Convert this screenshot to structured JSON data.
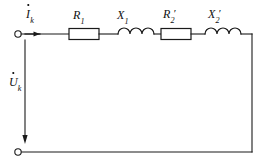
{
  "diagram": {
    "type": "electrical-schematic",
    "stroke_color": "#1a1a1a",
    "background_color": "#ffffff",
    "labels": {
      "current": {
        "symbol": "I",
        "subscript": "k",
        "prime": "",
        "overdot": true,
        "text": "İk"
      },
      "voltage": {
        "symbol": "U",
        "subscript": "k",
        "prime": "",
        "overdot": true,
        "text": "U̇k"
      },
      "r1": {
        "symbol": "R",
        "subscript": "1",
        "prime": "",
        "overdot": false,
        "text": "R1"
      },
      "x1": {
        "symbol": "X",
        "subscript": "1",
        "prime": "",
        "overdot": false,
        "text": "X1"
      },
      "r2": {
        "symbol": "R",
        "subscript": "2",
        "prime": "′",
        "overdot": false,
        "text": "R2′"
      },
      "x2": {
        "symbol": "X",
        "subscript": "2",
        "prime": "′",
        "overdot": false,
        "text": "X2′"
      }
    },
    "components": [
      {
        "name": "resistor-r1",
        "kind": "resistor",
        "label": "R1"
      },
      {
        "name": "inductor-x1",
        "kind": "inductor",
        "label": "X1"
      },
      {
        "name": "resistor-r2",
        "kind": "resistor",
        "label": "R2′"
      },
      {
        "name": "inductor-x2",
        "kind": "inductor",
        "label": "X2′"
      }
    ],
    "terminals": [
      {
        "name": "terminal-top-left",
        "position": "top-left"
      },
      {
        "name": "terminal-bottom-left",
        "position": "bottom-left"
      }
    ],
    "arrows": [
      {
        "name": "current-arrow",
        "direction": "right",
        "label": "İk"
      },
      {
        "name": "voltage-arrow",
        "direction": "down",
        "label": "U̇k"
      }
    ]
  }
}
